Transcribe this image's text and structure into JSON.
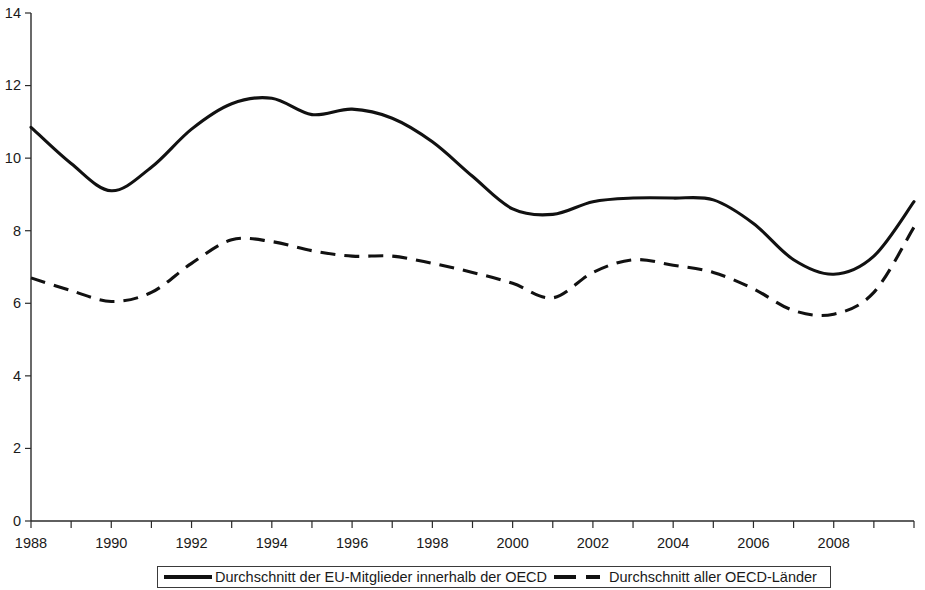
{
  "chart_data": {
    "type": "line",
    "title": "",
    "subtitle": "",
    "xlabel": "",
    "ylabel": "",
    "xlim": [
      1988,
      2010
    ],
    "ylim": [
      0,
      14
    ],
    "grid": false,
    "legend_position": "bottom",
    "y_ticks": [
      "0",
      "2",
      "4",
      "6",
      "8",
      "10",
      "12",
      "14"
    ],
    "y_tick_values": [
      0,
      2,
      4,
      6,
      8,
      10,
      12,
      14
    ],
    "x_ticks": [
      "1988",
      "1990",
      "1992",
      "1994",
      "1996",
      "1998",
      "2000",
      "2002",
      "2004",
      "2006",
      "2008"
    ],
    "x_tick_values": [
      1988,
      1990,
      1992,
      1994,
      1996,
      1998,
      2000,
      2002,
      2004,
      2006,
      2008
    ],
    "x_minor_tick_interval": 1,
    "x": [
      1988,
      1989,
      1990,
      1991,
      1992,
      1993,
      1994,
      1995,
      1996,
      1997,
      1998,
      1999,
      2000,
      2001,
      2002,
      2003,
      2004,
      2005,
      2006,
      2007,
      2008,
      2009,
      2010
    ],
    "series": [
      {
        "name": "Durchschnitt der EU-Mitglieder innerhalb der OECD",
        "style": "solid",
        "color": "#111111",
        "values": [
          10.85,
          9.85,
          9.1,
          9.75,
          10.8,
          11.5,
          11.65,
          11.2,
          11.35,
          11.1,
          10.45,
          9.5,
          8.6,
          8.45,
          8.8,
          8.9,
          8.9,
          8.85,
          8.2,
          7.2,
          6.8,
          7.3,
          8.8
        ]
      },
      {
        "name": "Durchschnitt aller OECD-Länder",
        "style": "dashed",
        "color": "#111111",
        "values": [
          6.7,
          6.35,
          6.05,
          6.3,
          7.1,
          7.75,
          7.7,
          7.45,
          7.3,
          7.3,
          7.1,
          6.85,
          6.55,
          6.15,
          6.85,
          7.2,
          7.05,
          6.85,
          6.4,
          5.8,
          5.7,
          6.3,
          8.1
        ]
      }
    ],
    "legend": [
      {
        "label": "Durchschnitt der EU-Mitglieder innerhalb der OECD",
        "style": "solid"
      },
      {
        "label": "Durchschnitt aller OECD-Länder",
        "style": "dashed"
      }
    ]
  }
}
